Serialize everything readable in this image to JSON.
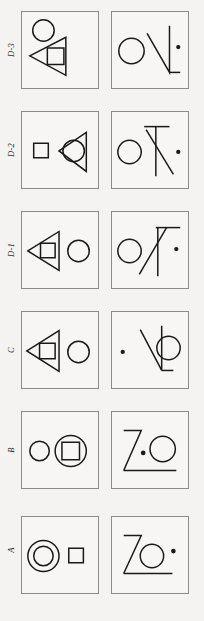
{
  "figure": {
    "background_color": "#f4f3f1",
    "stroke_color": "#1a1a1a",
    "panel_border_color": "#8d8b87",
    "columns": 2,
    "rows": 6,
    "row_labels_top_to_bottom": [
      "D-3",
      "D-2",
      "D-1",
      "C",
      "B",
      "A"
    ]
  },
  "rows": [
    {
      "label": "D-3",
      "left_panel": {
        "name": "panel-d3-left",
        "description": "Circle upper-left; left-pointing triangle with square inside, overlapping below",
        "shapes": [
          "circle",
          "triangle-left",
          "square"
        ]
      },
      "right_panel": {
        "name": "panel-d3-right",
        "description": "Circle at left; rotated angular Z/L stroke figure; small dot at right",
        "shapes": [
          "circle",
          "angular-stroke",
          "dot"
        ]
      }
    },
    {
      "label": "D-2",
      "left_panel": {
        "name": "panel-d2-left",
        "description": "Small square at left; left-pointing triangle with circle inside at right",
        "shapes": [
          "square",
          "triangle-left",
          "circle"
        ]
      },
      "right_panel": {
        "name": "panel-d2-right",
        "description": "Circle at left; T-like crossed strokes; small dot at right",
        "shapes": [
          "circle",
          "angular-stroke",
          "dot"
        ]
      }
    },
    {
      "label": "D-1",
      "left_panel": {
        "name": "panel-d1-left",
        "description": "Left-pointing triangle with square inside; circle at right",
        "shapes": [
          "triangle-left",
          "square",
          "circle"
        ]
      },
      "right_panel": {
        "name": "panel-d1-right",
        "description": "Circle at left; angled stroke figure with flag top; small dot at right",
        "shapes": [
          "circle",
          "angular-stroke",
          "dot"
        ]
      }
    },
    {
      "label": "C",
      "left_panel": {
        "name": "panel-c-left",
        "description": "Left-pointing triangle with square inside; circle at right",
        "shapes": [
          "triangle-left",
          "square",
          "circle"
        ]
      },
      "right_panel": {
        "name": "panel-c-right",
        "description": "Small dot at left; rotated angular stroke figure; circle at right",
        "shapes": [
          "dot",
          "angular-stroke",
          "circle"
        ]
      }
    },
    {
      "label": "B",
      "left_panel": {
        "name": "panel-b-left",
        "description": "Small circle at left; larger circle containing a square at right",
        "shapes": [
          "circle",
          "circle",
          "square"
        ]
      },
      "right_panel": {
        "name": "panel-b-right",
        "description": "Z-shaped stroke figure; small dot; circle at right",
        "shapes": [
          "z-stroke",
          "dot",
          "circle"
        ]
      }
    },
    {
      "label": "A",
      "left_panel": {
        "name": "panel-a-left",
        "description": "Concentric double circle at left; small square at right",
        "shapes": [
          "circle",
          "circle",
          "square"
        ]
      },
      "right_panel": {
        "name": "panel-a-right",
        "description": "Z-shaped stroke figure; circle; small dot at right",
        "shapes": [
          "z-stroke",
          "circle",
          "dot"
        ]
      }
    }
  ]
}
